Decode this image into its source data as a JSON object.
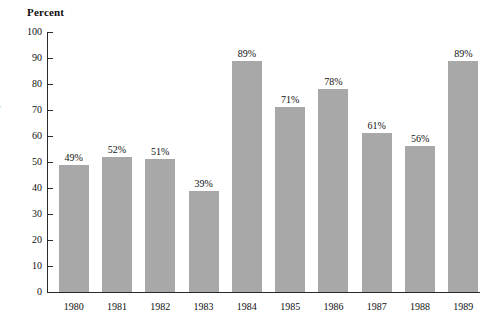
{
  "chart_data": {
    "type": "bar",
    "title": "Percent",
    "subtitle": "",
    "xlabel": "",
    "ylabel": "Percent",
    "categories": [
      "1980",
      "1981",
      "1982",
      "1983",
      "1984",
      "1985",
      "1986",
      "1987",
      "1988",
      "1989"
    ],
    "values": [
      49,
      52,
      51,
      39,
      89,
      71,
      78,
      61,
      56,
      89
    ],
    "data_labels": [
      "49%",
      "52%",
      "51%",
      "39%",
      "89%",
      "71%",
      "78%",
      "61%",
      "56%",
      "89%"
    ],
    "ylim": [
      0,
      100
    ],
    "ytick_step": 10,
    "ytick_labels": [
      "0",
      "10",
      "20",
      "30",
      "40",
      "50",
      "60",
      "70",
      "80",
      "90",
      "100"
    ],
    "grid": false,
    "legend": false,
    "legend_position": "none",
    "bar_color": "#a8a8a8",
    "axis_color": "#2b2b2b",
    "text_color": "#101010",
    "background_color": "#ffffff"
  },
  "margin_fragments": {
    "line1": "d-",
    "line2": "%",
    "line3": "d"
  }
}
